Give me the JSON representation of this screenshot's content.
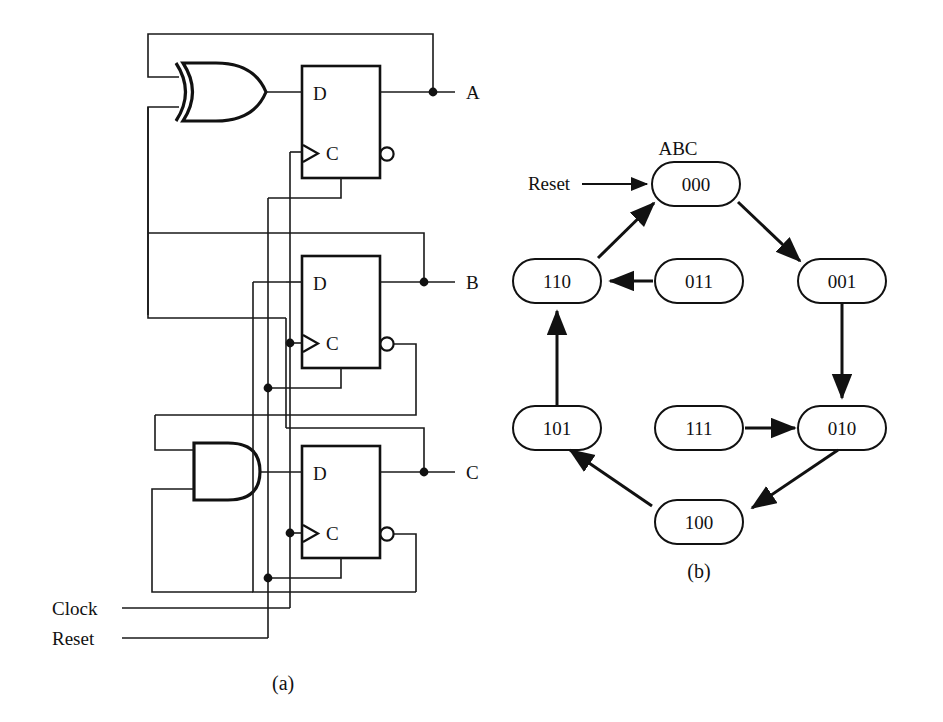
{
  "figure": {
    "panel_a": {
      "caption": "(a)",
      "outputs": [
        "A",
        "B",
        "C"
      ],
      "inputs": [
        "Clock",
        "Reset"
      ],
      "flipflops": [
        {
          "id": "ff-a",
          "d_label": "D",
          "c_label": "C",
          "output": "A"
        },
        {
          "id": "ff-b",
          "d_label": "D",
          "c_label": "C",
          "output": "B"
        },
        {
          "id": "ff-c",
          "d_label": "D",
          "c_label": "C",
          "output": "C"
        }
      ],
      "gates": [
        {
          "id": "xor-gate",
          "type": "XOR",
          "feeds": "ff-a"
        },
        {
          "id": "and-gate",
          "type": "AND",
          "feeds": "ff-c"
        }
      ],
      "clock_label": "Clock",
      "reset_label": "Reset"
    },
    "panel_b": {
      "caption": "(b)",
      "heading": "ABC",
      "reset_label": "Reset",
      "states": [
        {
          "id": "s000",
          "label": "000"
        },
        {
          "id": "s001",
          "label": "001"
        },
        {
          "id": "s010",
          "label": "010"
        },
        {
          "id": "s100",
          "label": "100"
        },
        {
          "id": "s101",
          "label": "101"
        },
        {
          "id": "s110",
          "label": "110"
        },
        {
          "id": "s011",
          "label": "011"
        },
        {
          "id": "s111",
          "label": "111"
        }
      ],
      "transitions": [
        {
          "from": "000",
          "to": "001"
        },
        {
          "from": "001",
          "to": "010"
        },
        {
          "from": "010",
          "to": "100"
        },
        {
          "from": "100",
          "to": "101"
        },
        {
          "from": "101",
          "to": "110"
        },
        {
          "from": "110",
          "to": "000"
        },
        {
          "from": "011",
          "to": "110"
        },
        {
          "from": "111",
          "to": "010"
        }
      ]
    }
  },
  "colors": {
    "ink": "#111111",
    "paper": "#ffffff"
  }
}
